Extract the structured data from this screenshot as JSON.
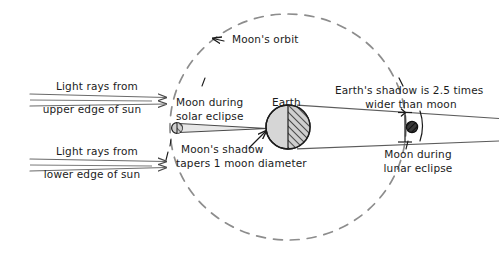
{
  "diagram": {
    "background_color": "#ffffff",
    "ink_color": "#1b1b1b",
    "stroke_color": "#5a5a5a",
    "orbit_color": "#8a8a8a",
    "earth_fill": "#d4d4d4",
    "moon_fill": "#cfcfcf",
    "shadow_moon_fill": "#3a3a3a"
  },
  "labels": {
    "orbit": "Moon's orbit",
    "light_upper_line1": "Light rays from",
    "light_upper_line2": "upper edge of sun",
    "light_lower_line1": "Light rays from",
    "light_lower_line2": "lower edge of sun",
    "moon_solar_line1": "Moon during",
    "moon_solar_line2": "solar eclipse",
    "earth": "Earth",
    "moon_shadow_line1": "Moon's shadow",
    "moon_shadow_line2": "tapers 1 moon diameter",
    "earth_shadow_line1": "Earth's shadow is 2.5 times",
    "earth_shadow_line2": "wider than moon",
    "moon_lunar_line1": "Moon during",
    "moon_lunar_line2": "lunar eclipse"
  },
  "annotations": {
    "shadow_ratio": "2.5",
    "moon_shadow_taper": "1 moon diameter"
  },
  "objects": {
    "earth": {
      "name": "Earth",
      "cx": 288,
      "cy": 127,
      "r": 22
    },
    "moon_solar": {
      "name": "Moon during solar eclipse",
      "cx": 177,
      "cy": 128,
      "r": 5
    },
    "moon_lunar": {
      "name": "Moon during lunar eclipse",
      "cx": 412,
      "cy": 127,
      "r": 5
    },
    "orbit": {
      "name": "Moon's orbit",
      "cx": 288,
      "cy": 127,
      "rx": 118,
      "ry": 113
    }
  }
}
